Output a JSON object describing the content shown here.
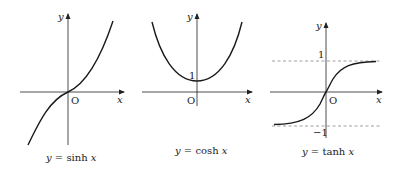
{
  "figure": {
    "panels": [
      {
        "id": "sinh",
        "caption": "y = sinh x",
        "caption_parts": {
          "lhs": "y",
          "eq": " = ",
          "fn": "sinh ",
          "arg": "x"
        },
        "x_axis_label": "x",
        "y_axis_label": "y",
        "origin_label": "O",
        "tick_labels": []
      },
      {
        "id": "cosh",
        "caption": "y = cosh x",
        "caption_parts": {
          "lhs": "y",
          "eq": " = ",
          "fn": "cosh ",
          "arg": "x"
        },
        "x_axis_label": "x",
        "y_axis_label": "y",
        "origin_label": "O",
        "tick_labels": [
          "1"
        ]
      },
      {
        "id": "tanh",
        "caption": "y = tanh x",
        "caption_parts": {
          "lhs": "y",
          "eq": " = ",
          "fn": "tanh ",
          "arg": "x"
        },
        "x_axis_label": "x",
        "y_axis_label": "y",
        "origin_label": "O",
        "tick_labels": [
          "1",
          "−1"
        ],
        "asymptotes": [
          "y = 1",
          "y = −1"
        ]
      }
    ],
    "colors": {
      "curve": "#1a1a1a",
      "axis": "#222222",
      "dash": "#777777"
    }
  }
}
